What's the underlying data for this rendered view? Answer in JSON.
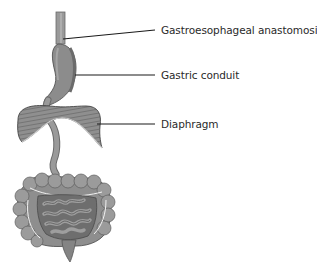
{
  "diagram": {
    "title": "",
    "labels": [
      {
        "id": "gastroesophageal-anastomosis",
        "text": "Gastroesophageal anastomosis",
        "x": 161,
        "y": 15
      },
      {
        "id": "gastric-conduit",
        "text": "Gastric conduit",
        "x": 161,
        "y": 68
      },
      {
        "id": "diaphragm",
        "text": "Diaphragm",
        "x": 161,
        "y": 118
      }
    ],
    "leader_lines": [
      {
        "to": "gastroesophageal-anastomosis",
        "x1": 63,
        "y1": 39,
        "x2": 155,
        "y2": 30
      },
      {
        "to": "gastric-conduit",
        "x1": 75,
        "y1": 75,
        "x2": 155,
        "y2": 75
      },
      {
        "to": "diaphragm",
        "x1": 97,
        "y1": 124,
        "x2": 155,
        "y2": 124
      }
    ],
    "structures": [
      "esophagus",
      "gastric conduit",
      "diaphragm",
      "small intestine",
      "large intestine",
      "rectum"
    ],
    "colors": {
      "tissue": "#8a8a8a",
      "tissue_light": "#a8a8a8",
      "tissue_dark": "#5e5e5e",
      "outline": "#4a4a4a",
      "leader": "#1a1a1a",
      "text": "#2a2a2a"
    }
  }
}
